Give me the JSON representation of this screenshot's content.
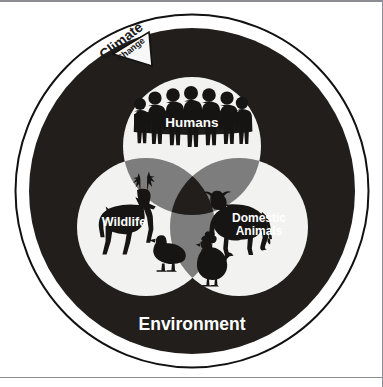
{
  "diagram": {
    "outer_ring_label": "Environment",
    "external_driver": {
      "line1": "Climate",
      "line2": "Change"
    },
    "sets": [
      {
        "id": "humans",
        "label": "Humans",
        "icon": "human-group-icon"
      },
      {
        "id": "wildlife",
        "label": "Wildlife",
        "icon": "deer-icon"
      },
      {
        "id": "domestic",
        "label_line1": "Domestic",
        "label_line2": "Animals",
        "label": "Domestic Animals",
        "icon": "cow-icon"
      }
    ],
    "intersection_icons": [
      {
        "id": "duck",
        "icon": "duck-icon",
        "region": "wildlife"
      },
      {
        "id": "chicken",
        "icon": "chicken-icon",
        "region": "wildlife-domestic"
      }
    ],
    "colors": {
      "environment_ring": "#211e1b",
      "circle_fill": "#f2f2f0",
      "pair_intersection": "#7d7d7d",
      "triple_intersection": "#221e1c",
      "silhouette": "#171513",
      "label_text": "#ffffff",
      "outline": "#111111",
      "page_background": "#ffffff",
      "frame_line": "#8c8c94"
    }
  }
}
